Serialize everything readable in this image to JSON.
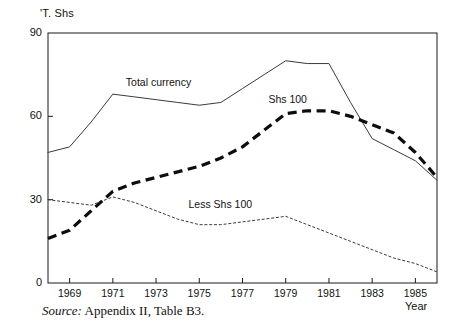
{
  "figure": {
    "yaxis_title": "'T. Shs",
    "xaxis_title": "Year",
    "source_label": "Source:",
    "source_text": "Appendix II, Table B3."
  },
  "series_labels": {
    "total_currency": "Total currency",
    "shs_100": "Shs 100",
    "less_shs_100": "Less Shs 100"
  },
  "chart_data": {
    "type": "line",
    "title": "",
    "xlabel": "Year",
    "ylabel": "'T. Shs",
    "xlim": [
      1968,
      1986
    ],
    "ylim": [
      0,
      90
    ],
    "yticks": [
      0,
      30,
      60,
      90
    ],
    "xticks": [
      1969,
      1971,
      1973,
      1975,
      1977,
      1979,
      1981,
      1983,
      1985
    ],
    "grid": false,
    "legend": "inline-annotations",
    "x": [
      1968,
      1969,
      1970,
      1971,
      1972,
      1973,
      1974,
      1975,
      1976,
      1977,
      1978,
      1979,
      1980,
      1981,
      1982,
      1983,
      1984,
      1985,
      1986
    ],
    "series": [
      {
        "name": "Total currency",
        "style": "solid-thin",
        "values": [
          47,
          49,
          58,
          68,
          67,
          66,
          65,
          64,
          65,
          70,
          75,
          80,
          79,
          79,
          65,
          52,
          48,
          44,
          37
        ]
      },
      {
        "name": "Shs 100",
        "style": "dashed-thick",
        "values": [
          16,
          19,
          26,
          33,
          36,
          38,
          40,
          42,
          45,
          49,
          55,
          61,
          62,
          62,
          60,
          57,
          54,
          47,
          38
        ]
      },
      {
        "name": "Less Shs 100",
        "style": "dotted-thin",
        "values": [
          30,
          29,
          28,
          31,
          29,
          26,
          23,
          21,
          21,
          22,
          23,
          24,
          21,
          18,
          15,
          12,
          9,
          7,
          4
        ]
      }
    ],
    "annotations": [
      {
        "text": "Total currency",
        "x": 1971.6,
        "y": 72
      },
      {
        "text": "Shs 100",
        "x": 1978.2,
        "y": 66
      },
      {
        "text": "Less Shs 100",
        "x": 1974.5,
        "y": 28
      }
    ]
  }
}
